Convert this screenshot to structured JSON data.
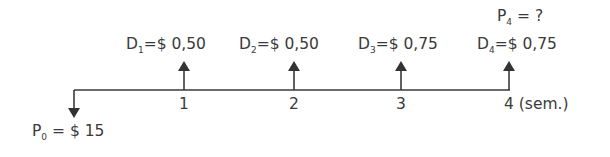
{
  "diagram": {
    "type": "cash-flow timeline",
    "initial": {
      "symbol": "P",
      "sub": "0",
      "text": " = $ 15"
    },
    "final_price": {
      "symbol": "P",
      "sub": "4",
      "text": " = ?"
    },
    "dividends": [
      {
        "symbol": "D",
        "sub": "1",
        "text": "=$ 0,50",
        "period": "1"
      },
      {
        "symbol": "D",
        "sub": "2",
        "text": "=$ 0,50",
        "period": "2"
      },
      {
        "symbol": "D",
        "sub": "3",
        "text": "=$ 0,75",
        "period": "3"
      },
      {
        "symbol": "D",
        "sub": "4",
        "text": "=$ 0,75",
        "period": "4"
      }
    ],
    "unit_label": " (sem.)",
    "line_color": "#3a3a3a"
  }
}
